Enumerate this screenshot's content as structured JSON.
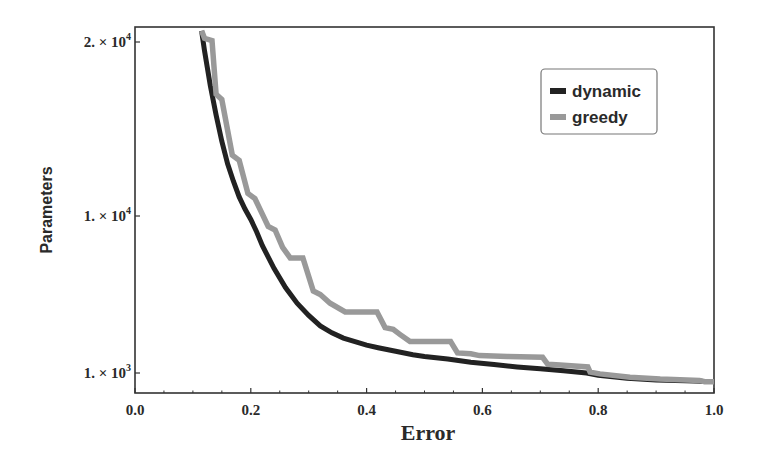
{
  "chart_data": {
    "type": "line",
    "title": "",
    "xlabel": "Error",
    "ylabel": "Parameters",
    "xlim": [
      0.0,
      1.0
    ],
    "y_ticks": [
      {
        "value": 1000,
        "label": "1. × 10",
        "exp": "3"
      },
      {
        "value": 10000,
        "label": "1. × 10",
        "exp": "4"
      },
      {
        "value": 20000,
        "label": "2. × 10",
        "exp": "4"
      }
    ],
    "x_ticks": [
      "0.0",
      "0.2",
      "0.4",
      "0.6",
      "0.8",
      "1.0"
    ],
    "x_tick_values": [
      0.0,
      0.2,
      0.4,
      0.6,
      0.8,
      1.0
    ],
    "grid": false,
    "legend": {
      "position": "upper right",
      "entries": [
        "dynamic",
        "greedy"
      ]
    },
    "series": [
      {
        "name": "dynamic",
        "color": "#222222",
        "points": [
          [
            0.115,
            21500
          ],
          [
            0.12,
            19500
          ],
          [
            0.13,
            17500
          ],
          [
            0.14,
            15800
          ],
          [
            0.15,
            14300
          ],
          [
            0.16,
            13000
          ],
          [
            0.17,
            12000
          ],
          [
            0.18,
            11100
          ],
          [
            0.19,
            10400
          ],
          [
            0.2,
            9800
          ],
          [
            0.21,
            9100
          ],
          [
            0.22,
            8300
          ],
          [
            0.24,
            7000
          ],
          [
            0.26,
            5900
          ],
          [
            0.28,
            5000
          ],
          [
            0.3,
            4300
          ],
          [
            0.32,
            3700
          ],
          [
            0.34,
            3300
          ],
          [
            0.36,
            3000
          ],
          [
            0.38,
            2800
          ],
          [
            0.4,
            2600
          ],
          [
            0.42,
            2450
          ],
          [
            0.45,
            2250
          ],
          [
            0.48,
            2050
          ],
          [
            0.5,
            1950
          ],
          [
            0.54,
            1800
          ],
          [
            0.58,
            1620
          ],
          [
            0.62,
            1480
          ],
          [
            0.66,
            1350
          ],
          [
            0.7,
            1240
          ],
          [
            0.74,
            1130
          ],
          [
            0.78,
            1000
          ],
          [
            0.8,
            950
          ],
          [
            0.85,
            880
          ],
          [
            0.9,
            840
          ],
          [
            0.95,
            820
          ],
          [
            0.98,
            810
          ]
        ]
      },
      {
        "name": "greedy",
        "color": "#999999",
        "points": [
          [
            0.115,
            21500
          ],
          [
            0.12,
            20500
          ],
          [
            0.133,
            20200
          ],
          [
            0.14,
            17000
          ],
          [
            0.15,
            16700
          ],
          [
            0.168,
            13500
          ],
          [
            0.18,
            13200
          ],
          [
            0.195,
            11300
          ],
          [
            0.207,
            11000
          ],
          [
            0.23,
            9400
          ],
          [
            0.242,
            9200
          ],
          [
            0.255,
            8200
          ],
          [
            0.268,
            7600
          ],
          [
            0.29,
            7600
          ],
          [
            0.308,
            5700
          ],
          [
            0.32,
            5500
          ],
          [
            0.337,
            5000
          ],
          [
            0.363,
            4500
          ],
          [
            0.418,
            4500
          ],
          [
            0.432,
            3600
          ],
          [
            0.446,
            3500
          ],
          [
            0.458,
            3200
          ],
          [
            0.475,
            2800
          ],
          [
            0.545,
            2800
          ],
          [
            0.557,
            2150
          ],
          [
            0.58,
            2100
          ],
          [
            0.595,
            2000
          ],
          [
            0.643,
            1950
          ],
          [
            0.643,
            1950
          ],
          [
            0.704,
            1900
          ],
          [
            0.713,
            1500
          ],
          [
            0.734,
            1450
          ],
          [
            0.782,
            1350
          ],
          [
            0.786,
            1050
          ],
          [
            0.803,
            980
          ],
          [
            0.855,
            900
          ],
          [
            0.907,
            860
          ],
          [
            0.975,
            830
          ],
          [
            0.984,
            800
          ],
          [
            1.0,
            800
          ]
        ]
      }
    ]
  }
}
